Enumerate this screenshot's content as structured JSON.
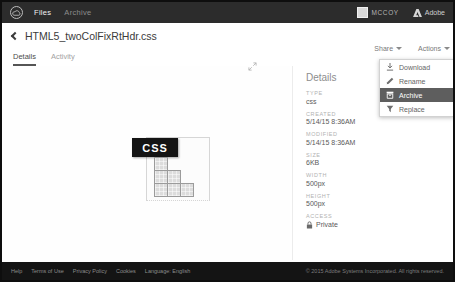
{
  "topbar": {
    "nav": [
      {
        "label": "Files"
      },
      {
        "label": "Archive"
      }
    ],
    "user_name": "MCCOY",
    "brand_label": "Adobe"
  },
  "header": {
    "title": "HTML5_twoColFixRtHdr.css"
  },
  "tabs": [
    {
      "label": "Details"
    },
    {
      "label": "Activity"
    }
  ],
  "preview": {
    "file_type_label": "CSS"
  },
  "sidebar": {
    "share_label": "Share",
    "actions_label": "Actions",
    "heading": "Details",
    "fields": [
      {
        "label": "TYPE",
        "value": "css"
      },
      {
        "label": "CREATED",
        "value": "5/14/15 8:36AM"
      },
      {
        "label": "MODIFIED",
        "value": "5/14/15 8:36AM"
      },
      {
        "label": "SIZE",
        "value": "6KB"
      },
      {
        "label": "WIDTH",
        "value": "500px"
      },
      {
        "label": "HEIGHT",
        "value": "500px"
      }
    ],
    "access": {
      "label": "ACCESS",
      "value": "Private"
    }
  },
  "actions_menu": {
    "items": [
      {
        "label": "Download"
      },
      {
        "label": "Rename"
      },
      {
        "label": "Archive"
      },
      {
        "label": "Replace"
      }
    ]
  },
  "footer": {
    "links": [
      "Help",
      "Terms of Use",
      "Privacy Policy",
      "Cookies",
      "Language: English"
    ],
    "copyright": "© 2015 Adobe Systems Incorporated. All rights reserved."
  },
  "colors": {
    "topbar_bg": "#2c2c2c",
    "footer_bg": "#141414",
    "highlight_row_bg": "#5e5e5e",
    "file_label_bg": "#141414",
    "accent_text": "#4c4c4c"
  }
}
